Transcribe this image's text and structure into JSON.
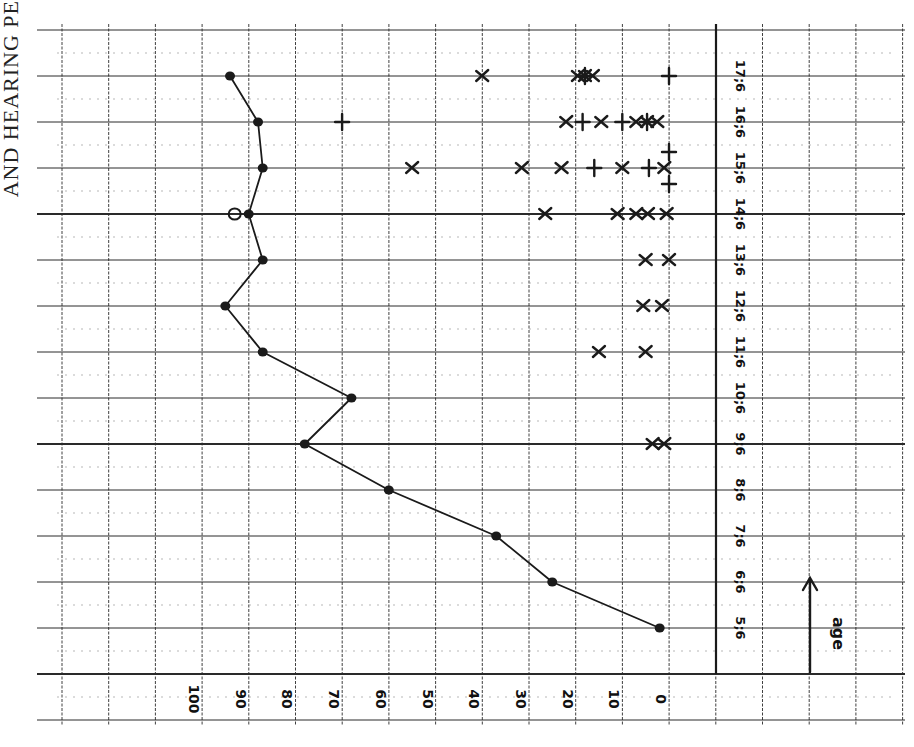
{
  "side_title": "AND HEARING PE",
  "colors": {
    "ink": "#1a1a1a",
    "grid": "#2a2a2a",
    "minor_grid": "#9a9a9a",
    "paper": "#ffffff"
  },
  "axis": {
    "value_ticks": [
      "100",
      "90",
      "80",
      "70",
      "60",
      "50",
      "40",
      "30",
      "20",
      "10",
      "0"
    ],
    "age_ticks": [
      "5;6",
      "6;6",
      "7;6",
      "8;6",
      "9;6",
      "10;6",
      "11;6",
      "12;6",
      "13;6",
      "14;6",
      "15;6",
      "16;6",
      "17;6"
    ],
    "age_axis_label": "age"
  },
  "chart_data": {
    "type": "line",
    "title": "",
    "xlabel": "age",
    "ylabel": "",
    "orientation": "rotated 90° (age runs bottom-to-top along right edge, values 100→0 left-to-right along bottom)",
    "ylim": [
      0,
      100
    ],
    "grid": true,
    "categories": [
      "5;6",
      "6;6",
      "7;6",
      "8;6",
      "9;6",
      "10;6",
      "11;6",
      "12;6",
      "13;6",
      "14;6",
      "15;6",
      "16;6",
      "17;6"
    ],
    "series": [
      {
        "name": "main (filled dots, connected)",
        "marker": "filled-circle",
        "values": [
          2,
          25,
          37,
          60,
          78,
          68,
          87,
          95,
          87,
          90,
          87,
          88,
          94
        ]
      }
    ],
    "extra_points": [
      {
        "age": "14;6",
        "value": 93,
        "marker": "open-circle"
      }
    ],
    "scatter_points": [
      {
        "age": "9;6",
        "value": 3.5,
        "marker": "x"
      },
      {
        "age": "9;6",
        "value": 1,
        "marker": "x"
      },
      {
        "age": "11;6",
        "value": 15,
        "marker": "x"
      },
      {
        "age": "11;6",
        "value": 5,
        "marker": "x"
      },
      {
        "age": "12;6",
        "value": 5.5,
        "marker": "x"
      },
      {
        "age": "12;6",
        "value": 1.5,
        "marker": "x"
      },
      {
        "age": "13;6",
        "value": 5,
        "marker": "x"
      },
      {
        "age": "13;6",
        "value": 0,
        "marker": "x"
      },
      {
        "age": "14;6",
        "value": 26.5,
        "marker": "x"
      },
      {
        "age": "14;6",
        "value": 11,
        "marker": "x"
      },
      {
        "age": "14;6",
        "value": 7,
        "marker": "x"
      },
      {
        "age": "14;6",
        "value": 4.5,
        "marker": "x"
      },
      {
        "age": "14;6",
        "value": 0.5,
        "marker": "x"
      },
      {
        "age": "15;6",
        "value": 55,
        "marker": "x"
      },
      {
        "age": "15;6",
        "value": 31.5,
        "marker": "x"
      },
      {
        "age": "15;6",
        "value": 23,
        "marker": "x"
      },
      {
        "age": "15;6",
        "value": 16,
        "marker": "+"
      },
      {
        "age": "15;6",
        "value": 10,
        "marker": "x"
      },
      {
        "age": "15;6",
        "value": 4.3,
        "marker": "+"
      },
      {
        "age": "15;6",
        "value": 1,
        "marker": "x"
      },
      {
        "age": "15;6",
        "value": 0,
        "marker": "+",
        "offset": "above"
      },
      {
        "age": "15;6",
        "value": 0,
        "marker": "+",
        "offset": "below"
      },
      {
        "age": "16;6",
        "value": 70,
        "marker": "+"
      },
      {
        "age": "16;6",
        "value": 22,
        "marker": "x"
      },
      {
        "age": "16;6",
        "value": 18.5,
        "marker": "+"
      },
      {
        "age": "16;6",
        "value": 14.5,
        "marker": "x"
      },
      {
        "age": "16;6",
        "value": 10,
        "marker": "+"
      },
      {
        "age": "16;6",
        "value": 7,
        "marker": "x"
      },
      {
        "age": "16;6",
        "value": 4.7,
        "marker": "x+"
      },
      {
        "age": "16;6",
        "value": 2.5,
        "marker": "x"
      },
      {
        "age": "17;6",
        "value": 40,
        "marker": "x"
      },
      {
        "age": "17;6",
        "value": 19.5,
        "marker": "x"
      },
      {
        "age": "17;6",
        "value": 18,
        "marker": "x+"
      },
      {
        "age": "17;6",
        "value": 16.3,
        "marker": "x"
      },
      {
        "age": "17;6",
        "value": 0,
        "marker": "+"
      }
    ]
  }
}
